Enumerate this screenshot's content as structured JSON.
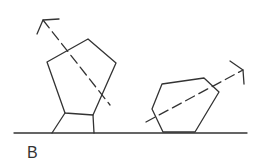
{
  "figure": {
    "label": "B",
    "stroke_color": "#333333",
    "background": "#ffffff",
    "objects": [
      {
        "name": "left-pentagon",
        "description": "tilted pentagon standing on two legs with dashed arrow pointing up-left"
      },
      {
        "name": "right-hexagon",
        "description": "tilted polygon resting on ground with dashed arrow pointing up-right"
      }
    ]
  }
}
